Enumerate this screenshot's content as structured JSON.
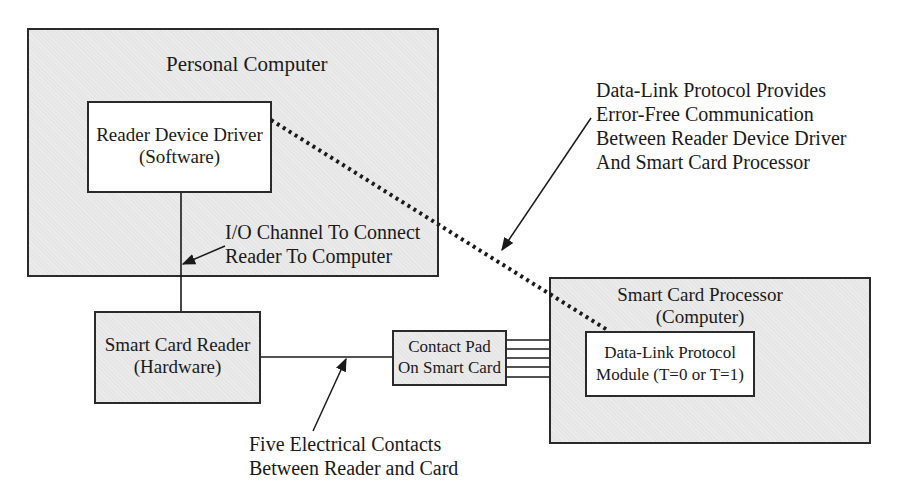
{
  "diagram": {
    "personal_computer": {
      "title": "Personal Computer"
    },
    "reader_device_driver": {
      "line1": "Reader Device Driver",
      "line2": "(Software)"
    },
    "io_channel_note": {
      "line1": "I/O Channel To Connect",
      "line2": "Reader To Computer"
    },
    "smart_card_reader": {
      "line1": "Smart Card Reader",
      "line2": "(Hardware)"
    },
    "contact_pad": {
      "line1": "Contact Pad",
      "line2": "On Smart Card"
    },
    "smart_card_processor": {
      "line1": "Smart Card Processor",
      "line2": "(Computer)"
    },
    "data_link_module": {
      "line1": "Data-Link Protocol",
      "line2": "Module (T=0 or T=1)"
    },
    "data_link_note": {
      "line1": "Data-Link Protocol Provides",
      "line2": "Error-Free Communication",
      "line3": "Between Reader Device Driver",
      "line4": "And Smart Card Processor"
    },
    "contacts_note": {
      "line1": "Five Electrical Contacts",
      "line2": "Between Reader and Card"
    },
    "contact_line_count": 5,
    "colors": {
      "box_fill": "#e6e6e6",
      "inner_fill": "#ffffff",
      "line": "#1a1a1a"
    }
  }
}
